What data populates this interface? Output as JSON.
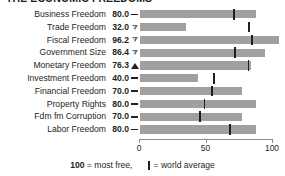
{
  "title": "THE ECONOMIC FREEDOMS",
  "footer": {
    "most_free_value": "100",
    "most_free_text": "= most free,",
    "world_average_text": "= world average",
    "world_average_marker": "world-average-tick"
  },
  "colors": {
    "bar": "#a0a0a0",
    "marker": "#231f20",
    "axis": "#8c8c8c",
    "text": "#231f20"
  },
  "chart_data": {
    "type": "bar",
    "title": "THE ECONOMIC FREEDOMS",
    "xlabel": "",
    "ylabel": "",
    "xlim": [
      0,
      100
    ],
    "ticks": [
      "0",
      "50",
      "100"
    ],
    "tick_values": [
      0,
      50,
      100
    ],
    "grid": false,
    "orientation": "horizontal",
    "legend": "100 = most free,  | = world average",
    "categories": [
      "Business Freedom",
      "Trade Freedom",
      "Fiscal Freedom",
      "Government Size",
      "Monetary Freedom",
      "Investment Freedom",
      "Financial Freedom",
      "Property Rights",
      "Fdm fm Corruption",
      "Labor Freedom"
    ],
    "values": [
      80.0,
      32.0,
      96.2,
      86.4,
      76.3,
      40.0,
      70.0,
      80.0,
      70.0,
      80.0
    ],
    "value_labels": [
      "80.0",
      "32.0",
      "96.2",
      "86.4",
      "76.3",
      "40.0",
      "70.0",
      "80.0",
      "70.0",
      "80.0"
    ],
    "trend": [
      "flat",
      "down",
      "down",
      "down",
      "up",
      "flat",
      "flat",
      "flat",
      "flat",
      "flat"
    ],
    "trend_icons": [
      "dash-icon",
      "triangle-down-icon",
      "triangle-down-icon",
      "triangle-down-icon",
      "triangle-up-icon",
      "dash-icon",
      "dash-icon",
      "dash-icon",
      "dash-icon",
      "dash-icon"
    ],
    "world_average": [
      64.3,
      74.8,
      76.3,
      65.0,
      74.2,
      50.2,
      49.0,
      43.8,
      40.5,
      61.5
    ],
    "series": [
      {
        "name": "Country score",
        "values": [
          80.0,
          32.0,
          96.2,
          86.4,
          76.3,
          40.0,
          70.0,
          80.0,
          70.0,
          80.0
        ]
      },
      {
        "name": "World average",
        "values": [
          64.3,
          74.8,
          76.3,
          65.0,
          74.2,
          50.2,
          49.0,
          43.8,
          40.5,
          61.5
        ]
      }
    ]
  }
}
